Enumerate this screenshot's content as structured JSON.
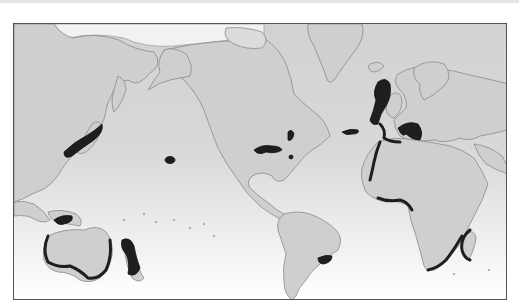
{
  "map": {
    "title": "",
    "projection": "world-pacific-centered",
    "colors": {
      "ocean_top": "#d2d2d2",
      "ocean_bottom": "#ffffff",
      "land": "#cfcfcf",
      "coastline": "#8a8a8a",
      "highlight": "#1e1e1e",
      "frame": "#555555"
    },
    "highlighted_regions": [
      {
        "id": "japan-pacific-coast",
        "label": "Japan Pacific coast"
      },
      {
        "id": "hawaii",
        "label": "Hawaii"
      },
      {
        "id": "gulf-of-mexico-north",
        "label": "Northern Gulf of Mexico"
      },
      {
        "id": "us-east-coast",
        "label": "US mid-Atlantic coast"
      },
      {
        "id": "bahamas",
        "label": "Bahamas"
      },
      {
        "id": "azores",
        "label": "Azores"
      },
      {
        "id": "british-isles-north-sea",
        "label": "British Isles / North Sea"
      },
      {
        "id": "western-europe-coast",
        "label": "Atlantic coast of Europe"
      },
      {
        "id": "mediterranean",
        "label": "Mediterranean"
      },
      {
        "id": "west-africa-coast",
        "label": "Northwest Africa coast"
      },
      {
        "id": "gulf-of-guinea",
        "label": "Gulf of Guinea"
      },
      {
        "id": "southeast-africa",
        "label": "Southeast Africa coast"
      },
      {
        "id": "madagascar",
        "label": "Madagascar"
      },
      {
        "id": "south-brazil-uruguay",
        "label": "Southern Brazil / Uruguay"
      },
      {
        "id": "indonesia",
        "label": "Indonesia"
      },
      {
        "id": "australia-south-coast",
        "label": "Southern Australia coast"
      },
      {
        "id": "new-zealand",
        "label": "New Zealand"
      }
    ]
  }
}
